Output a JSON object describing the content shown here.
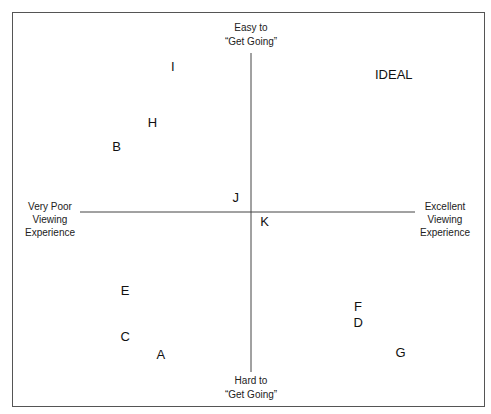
{
  "chart_data": {
    "type": "scatter",
    "title": "",
    "xlabel_left": [
      "Very Poor",
      "Viewing",
      "Experience"
    ],
    "xlabel_right": [
      "Excellent",
      "Viewing",
      "Experience"
    ],
    "ylabel_top": [
      "Easy to",
      "“Get Going”"
    ],
    "ylabel_bottom": [
      "Hard to",
      "“Get Going”"
    ],
    "xlim": [
      -10,
      10
    ],
    "ylim": [
      -10,
      10
    ],
    "grid": false,
    "legend": "none",
    "points": [
      {
        "label": "I",
        "x": -4.6,
        "y": 9.1
      },
      {
        "label": "IDEAL",
        "x": 8.4,
        "y": 8.6
      },
      {
        "label": "H",
        "x": -5.8,
        "y": 5.6
      },
      {
        "label": "B",
        "x": -7.9,
        "y": 4.1
      },
      {
        "label": "J",
        "x": -0.9,
        "y": 0.9
      },
      {
        "label": "K",
        "x": 0.8,
        "y": -0.6
      },
      {
        "label": "E",
        "x": -7.4,
        "y": -4.9
      },
      {
        "label": "F",
        "x": 6.3,
        "y": -5.9
      },
      {
        "label": "D",
        "x": 6.3,
        "y": -6.9
      },
      {
        "label": "C",
        "x": -7.4,
        "y": -7.8
      },
      {
        "label": "A",
        "x": -5.3,
        "y": -8.9
      },
      {
        "label": "G",
        "x": 8.8,
        "y": -8.8
      }
    ],
    "colors": {
      "frame": "#555555",
      "axes": "#444444",
      "text": "#111111"
    }
  }
}
